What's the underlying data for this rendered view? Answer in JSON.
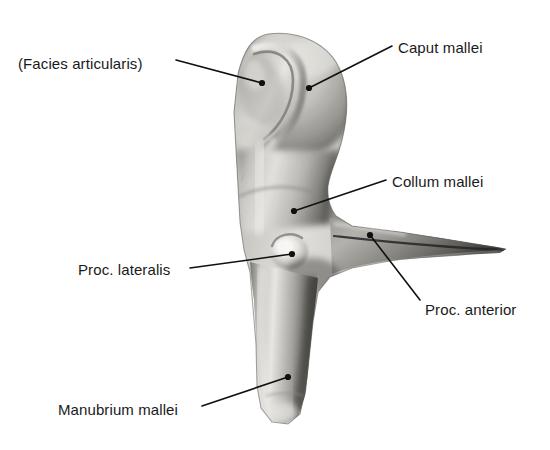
{
  "figure": {
    "view": "lateral view of right malleus (auditory ossicle)",
    "background_color": "#ffffff",
    "line_color": "#101010",
    "text_color": "#1a1a1a",
    "bone_tone_light": "#f2f1ef",
    "bone_tone_mid": "#b3b1ac",
    "bone_tone_dark": "#636360",
    "bone_tone_darkest": "#2e2e2c"
  },
  "labels": [
    {
      "id": "facies-articularis",
      "text": "(Facies articularis)",
      "text_x": 18,
      "text_y": 56,
      "leader_from_x": 176,
      "leader_from_y": 60,
      "leader_to_x": 262,
      "leader_to_y": 83
    },
    {
      "id": "caput-mallei",
      "text": "Caput mallei",
      "text_x": 398,
      "text_y": 40,
      "leader_from_x": 392,
      "leader_from_y": 46,
      "leader_to_x": 309,
      "leader_to_y": 88
    },
    {
      "id": "collum-mallei",
      "text": "Collum mallei",
      "text_x": 392,
      "text_y": 174,
      "leader_from_x": 386,
      "leader_from_y": 180,
      "leader_to_x": 294,
      "leader_to_y": 211
    },
    {
      "id": "proc-lateralis",
      "text": "Proc. lateralis",
      "text_x": 78,
      "text_y": 262,
      "leader_from_x": 190,
      "leader_from_y": 268,
      "leader_to_x": 292,
      "leader_to_y": 254
    },
    {
      "id": "proc-anterior",
      "text": "Proc. anterior",
      "text_x": 425,
      "text_y": 302,
      "leader_from_x": 420,
      "leader_from_y": 300,
      "leader_to_x": 370,
      "leader_to_y": 235
    },
    {
      "id": "manubrium-mallei",
      "text": "Manubrium mallei",
      "text_x": 58,
      "text_y": 402,
      "leader_from_x": 202,
      "leader_from_y": 406,
      "leader_to_x": 288,
      "leader_to_y": 377
    }
  ],
  "anatomy_parts": [
    {
      "id": "caput",
      "name": "Caput mallei",
      "description": "rounded head of the malleus"
    },
    {
      "id": "facies",
      "name": "Facies articularis",
      "description": "crescent articular facet on the head"
    },
    {
      "id": "collum",
      "name": "Collum mallei",
      "description": "neck below the head"
    },
    {
      "id": "proc-lateralis",
      "name": "Proc. lateralis",
      "description": "lateral process knob"
    },
    {
      "id": "proc-anterior",
      "name": "Proc. anterior",
      "description": "long slender anterior process"
    },
    {
      "id": "manubrium",
      "name": "Manubrium mallei",
      "description": "handle descending from the neck"
    }
  ]
}
